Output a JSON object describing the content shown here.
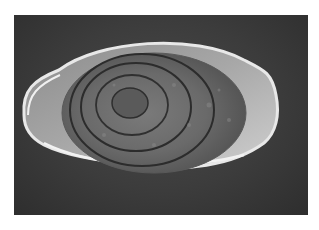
{
  "image": {
    "subject": "parasite egg micrograph",
    "description": "Grayscale light-microscopy image of an oval, operculated helminth egg with a thick bright shell and concentric internal rings, on a dark background with a white border",
    "colors": {
      "border": "#ffffff",
      "background": "#3a3a3a",
      "shell_highlight": "#e6e6e6",
      "shell_mid": "#9a9a9a",
      "interior": "#6e6e6e",
      "rings": "#2a2a2a"
    }
  }
}
